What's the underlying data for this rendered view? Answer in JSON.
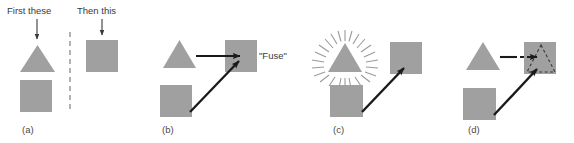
{
  "figure": {
    "width": 574,
    "height": 143,
    "background": "#ffffff",
    "shape_fill": "#a0a0a0",
    "arrow_color": "#1a1a1a",
    "text_color": "#3a3a3a",
    "caption_color": "#4a4a4a",
    "divider_color": "#8a8a8a"
  },
  "headers": {
    "first": "First these",
    "then": "Then this"
  },
  "annotations": {
    "fuse": "\"Fuse\""
  },
  "panels": [
    {
      "id": "a",
      "caption": "(a)",
      "caption_x": 22,
      "caption_y": 133,
      "description": "Two source shapes left of a dashed divider, one target square right of it",
      "shapes": [
        {
          "name": "source-triangle",
          "type": "triangle",
          "x": 20,
          "y": 45,
          "width": 35,
          "height": 27,
          "fill": "#a0a0a0"
        },
        {
          "name": "source-square",
          "type": "square",
          "x": 20,
          "y": 80,
          "width": 32,
          "height": 32,
          "fill": "#a0a0a0"
        },
        {
          "name": "target-square",
          "type": "square",
          "x": 86,
          "y": 40,
          "width": 32,
          "height": 32,
          "fill": "#a0a0a0"
        }
      ],
      "divider": {
        "x": 70,
        "y1": 32,
        "y2": 113
      },
      "header_arrows": [
        {
          "name": "first-these-arrow",
          "x": 37,
          "y1": 19,
          "y2": 40
        },
        {
          "name": "then-this-arrow",
          "x": 102,
          "y1": 19,
          "y2": 36
        }
      ]
    },
    {
      "id": "b",
      "caption": "(b)",
      "caption_x": 162,
      "caption_y": 133,
      "description": "Triangle and square both point with solid arrows into a target square labeled Fuse",
      "shapes": [
        {
          "name": "source-triangle",
          "type": "triangle",
          "x": 163,
          "y": 40,
          "width": 33,
          "height": 28,
          "fill": "#a0a0a0"
        },
        {
          "name": "source-square",
          "type": "square",
          "x": 160,
          "y": 85,
          "width": 32,
          "height": 32,
          "fill": "#a0a0a0"
        },
        {
          "name": "target-square",
          "type": "square",
          "x": 225,
          "y": 40,
          "width": 32,
          "height": 32,
          "fill": "#a0a0a0"
        }
      ],
      "arrows": [
        {
          "name": "triangle-to-target-arrow",
          "style": "solid",
          "x1": 196,
          "y1": 56,
          "x2": 237,
          "y2": 56
        },
        {
          "name": "square-to-target-arrow",
          "style": "solid",
          "x1": 190,
          "y1": 112,
          "x2": 236,
          "y2": 63
        }
      ],
      "label": {
        "name": "fuse-label",
        "x": 259,
        "y": 59
      }
    },
    {
      "id": "c",
      "caption": "(c)",
      "caption_x": 333,
      "caption_y": 133,
      "description": "Triangle highlighted with a radiating starburst, square points to target square",
      "shapes": [
        {
          "name": "highlighted-triangle",
          "type": "triangle",
          "x": 328,
          "y": 43,
          "width": 34,
          "height": 29,
          "fill": "#a0a0a0",
          "starburst": true
        },
        {
          "name": "source-square",
          "type": "square",
          "x": 330,
          "y": 85,
          "width": 33,
          "height": 32,
          "fill": "#a0a0a0"
        },
        {
          "name": "target-square",
          "type": "square",
          "x": 390,
          "y": 42,
          "width": 32,
          "height": 32,
          "fill": "#a0a0a0"
        }
      ],
      "arrows": [
        {
          "name": "square-to-target-arrow",
          "style": "solid",
          "x1": 362,
          "y1": 112,
          "x2": 401,
          "y2": 70
        }
      ],
      "starburst": {
        "cx": 345,
        "cy": 60,
        "rays": 28,
        "inner": 19,
        "outer": 28
      }
    },
    {
      "id": "d",
      "caption": "(d)",
      "caption_x": 468,
      "caption_y": 133,
      "description": "Triangle connects via a solid-then-dashed arrow to a target square containing a dashed triangle outline",
      "shapes": [
        {
          "name": "source-triangle",
          "type": "triangle",
          "x": 466,
          "y": 42,
          "width": 34,
          "height": 28,
          "fill": "#a0a0a0"
        },
        {
          "name": "source-square",
          "type": "square",
          "x": 463,
          "y": 88,
          "width": 33,
          "height": 32,
          "fill": "#a0a0a0"
        },
        {
          "name": "target-square",
          "type": "square",
          "x": 524,
          "y": 42,
          "width": 32,
          "height": 32,
          "fill": "#a0a0a0"
        },
        {
          "name": "ghost-triangle-outline",
          "type": "triangle-outline",
          "x": 527,
          "y": 45,
          "width": 28,
          "height": 27,
          "stroke": "#3a3a3a",
          "dashed": true
        }
      ],
      "arrows": [
        {
          "name": "triangle-solid-segment",
          "style": "solid",
          "x1": 500,
          "y1": 57,
          "x2": 521,
          "y2": 57
        },
        {
          "name": "triangle-dashed-segment",
          "style": "dashed",
          "x1": 513,
          "y1": 57,
          "x2": 535,
          "y2": 57
        },
        {
          "name": "square-to-target-arrow",
          "style": "solid",
          "x1": 494,
          "y1": 115,
          "x2": 534,
          "y2": 72
        }
      ]
    }
  ]
}
